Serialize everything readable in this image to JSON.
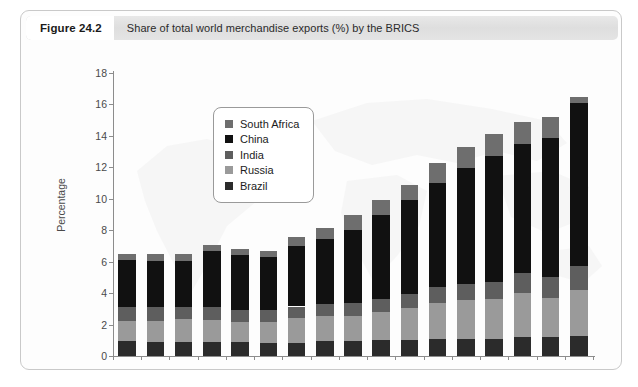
{
  "figure": {
    "number": "Figure 24.2",
    "caption": "Share of total world merchandise exports (%) by the BRICS"
  },
  "chart_data": {
    "type": "bar",
    "stacked": true,
    "title": "Share of total world merchandise exports (%) by the BRICS",
    "xlabel": "",
    "ylabel": "Percentage",
    "ylim": [
      0,
      18
    ],
    "yticks": [
      0,
      2,
      4,
      6,
      8,
      10,
      12,
      14,
      16,
      18
    ],
    "grid": false,
    "legend_position": "upper-left-inside",
    "categories": [
      "1994",
      "1995",
      "1996",
      "1997",
      "1998",
      "1999",
      "2000",
      "2001",
      "2002",
      "2003",
      "2004",
      "2005",
      "2006",
      "2007",
      "2008",
      "2009",
      "2010"
    ],
    "xtick_labels": [
      "1994",
      "1996",
      "1998",
      "2000",
      "2002",
      "2004",
      "2006",
      "2008",
      "2010"
    ],
    "series": [
      {
        "name": "Brazil",
        "color": "#2b2b2b",
        "values": [
          0.95,
          0.9,
          0.9,
          0.9,
          0.9,
          0.85,
          0.85,
          0.95,
          0.95,
          1.0,
          1.05,
          1.1,
          1.1,
          1.1,
          1.2,
          1.2,
          1.3
        ]
      },
      {
        "name": "Russia",
        "color": "#9a9a9a",
        "values": [
          1.25,
          1.35,
          1.45,
          1.4,
          1.25,
          1.3,
          1.55,
          1.6,
          1.6,
          1.8,
          2.0,
          2.3,
          2.45,
          2.5,
          2.8,
          2.5,
          2.9
        ]
      },
      {
        "name": "India",
        "color": "#5e5e5e",
        "values": [
          0.9,
          0.85,
          0.75,
          0.8,
          0.8,
          0.75,
          0.75,
          0.75,
          0.8,
          0.8,
          0.9,
          1.0,
          1.05,
          1.1,
          1.25,
          1.3,
          1.5
        ]
      },
      {
        "name": "China",
        "color": "#111111",
        "values": [
          3.0,
          2.95,
          2.95,
          3.6,
          3.45,
          3.4,
          3.85,
          4.15,
          4.65,
          5.35,
          6.0,
          6.6,
          7.35,
          8.05,
          8.25,
          8.85,
          10.4
        ]
      },
      {
        "name": "South Africa",
        "color": "#6e6e6e",
        "values": [
          0.4,
          0.45,
          0.45,
          0.35,
          0.4,
          0.4,
          0.55,
          0.7,
          0.95,
          1.0,
          0.95,
          1.3,
          1.35,
          1.35,
          1.4,
          1.35,
          0.4
        ]
      }
    ],
    "totals": [
      6.5,
      6.5,
      6.5,
      7.05,
      6.8,
      6.7,
      7.55,
      8.15,
      8.95,
      9.95,
      10.9,
      12.3,
      13.3,
      14.1,
      14.9,
      15.2,
      16.5
    ]
  },
  "legend": {
    "items": [
      {
        "label": "South Africa",
        "color": "#6e6e6e"
      },
      {
        "label": "China",
        "color": "#111111"
      },
      {
        "label": "India",
        "color": "#5e5e5e"
      },
      {
        "label": "Russia",
        "color": "#9a9a9a"
      },
      {
        "label": "Brazil",
        "color": "#2b2b2b"
      }
    ]
  }
}
